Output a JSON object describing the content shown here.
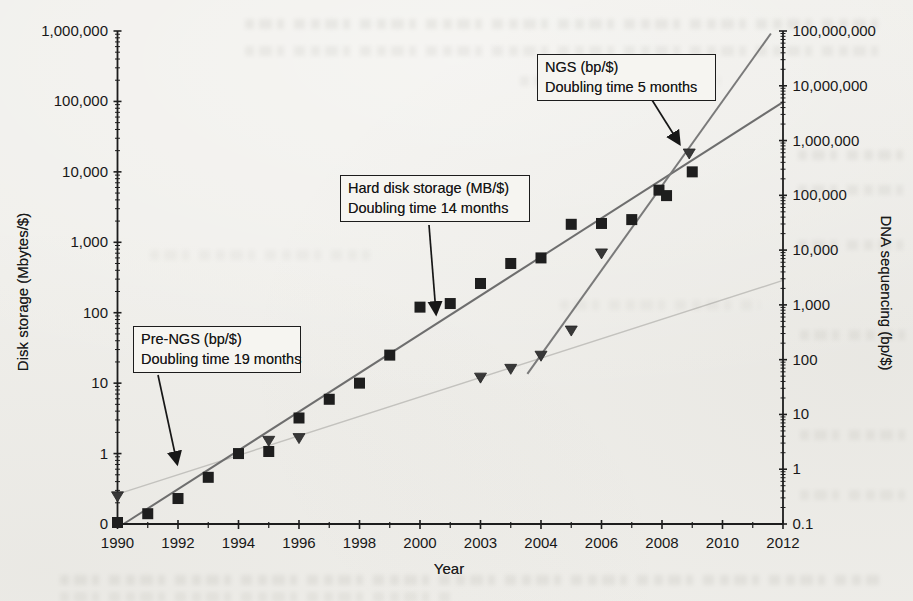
{
  "figure": {
    "xlabel": "Year",
    "ylabel_left": "Disk storage (Mbytes/$)",
    "ylabel_right": "DNA sequencing (bp/$)"
  },
  "annotations": {
    "pre_ngs": {
      "line1": "Pre-NGS (bp/$)",
      "line2": "Doubling time 19 months"
    },
    "hdd": {
      "line1": "Hard disk storage (MB/$)",
      "line2": "Doubling time 14 months"
    },
    "ngs": {
      "line1": "NGS (bp/$)",
      "line2": "Doubling time 5 months"
    }
  },
  "chart_data": {
    "type": "scatter",
    "title": "",
    "xlabel": "Year",
    "x_axis": {
      "range": [
        1990,
        2012
      ],
      "major_ticks": [
        {
          "year": 1990,
          "label": "1990"
        },
        {
          "year": 1992,
          "label": "1992"
        },
        {
          "year": 1994,
          "label": "1994"
        },
        {
          "year": 1996,
          "label": "1996"
        },
        {
          "year": 1998,
          "label": "1998"
        },
        {
          "year": 2000,
          "label": "2000"
        },
        {
          "year": 2002,
          "label": "2003"
        },
        {
          "year": 2004,
          "label": "2004"
        },
        {
          "year": 2006,
          "label": "2006"
        },
        {
          "year": 2008,
          "label": "2008"
        },
        {
          "year": 2010,
          "label": "2010"
        },
        {
          "year": 2012,
          "label": "2012"
        }
      ],
      "minor_tick_years": [
        1991,
        1993,
        1995,
        1997,
        1999,
        2001,
        2003,
        2005,
        2007,
        2009,
        2011
      ]
    },
    "left_axis": {
      "label": "Disk storage (Mbytes/$)",
      "scale": "log",
      "range": [
        0.1,
        1000000
      ],
      "ticks": [
        {
          "value": 1000000,
          "label": "1,000,000"
        },
        {
          "value": 100000,
          "label": "100,000"
        },
        {
          "value": 10000,
          "label": "10,000"
        },
        {
          "value": 1000,
          "label": "1,000"
        },
        {
          "value": 100,
          "label": "100"
        },
        {
          "value": 10,
          "label": "10"
        },
        {
          "value": 1,
          "label": "1"
        },
        {
          "value": 0.1,
          "label": "0"
        }
      ]
    },
    "right_axis": {
      "label": "DNA sequencing (bp/$)",
      "scale": "log",
      "range": [
        0.1,
        100000000
      ],
      "ticks": [
        {
          "value": 100000000,
          "label": "100,000,000"
        },
        {
          "value": 10000000,
          "label": "10,000,000"
        },
        {
          "value": 1000000,
          "label": "1,000,000"
        },
        {
          "value": 100000,
          "label": "100,000"
        },
        {
          "value": 10000,
          "label": "10,000"
        },
        {
          "value": 1000,
          "label": "1,000"
        },
        {
          "value": 100,
          "label": "100"
        },
        {
          "value": 10,
          "label": "10"
        },
        {
          "value": 1,
          "label": "1"
        },
        {
          "value": 0.1,
          "label": "0.1"
        }
      ]
    },
    "series": [
      {
        "name": "Hard disk storage (MB/$)",
        "marker": "square",
        "axis": "left",
        "doubling_time": "14 months",
        "color": "#1e1e1e",
        "points": [
          [
            1990,
            0.105
          ],
          [
            1991,
            0.14
          ],
          [
            1992,
            0.23
          ],
          [
            1993,
            0.46
          ],
          [
            1994,
            1.0
          ],
          [
            1995,
            1.07
          ],
          [
            1996,
            3.2
          ],
          [
            1997,
            5.9
          ],
          [
            1998,
            10
          ],
          [
            1999,
            25
          ],
          [
            2000,
            120
          ],
          [
            2001,
            135
          ],
          [
            2002,
            260
          ],
          [
            2003,
            500
          ],
          [
            2004,
            600
          ],
          [
            2005,
            1800
          ],
          [
            2006,
            1850
          ],
          [
            2007,
            2100
          ],
          [
            2007.9,
            5500
          ],
          [
            2008.15,
            4600
          ],
          [
            2009,
            10000
          ]
        ]
      },
      {
        "name": "DNA sequencing (bp/$)",
        "marker": "triangle-down",
        "axis": "right",
        "doubling_time_pre_ngs": "19 months",
        "doubling_time_ngs": "5 months",
        "color": "#383838",
        "points": [
          [
            1990,
            0.32
          ],
          [
            1995,
            3.3
          ],
          [
            1996,
            3.7
          ],
          [
            2002,
            47
          ],
          [
            2003,
            68
          ],
          [
            2004,
            118
          ],
          [
            2005,
            340
          ],
          [
            2006,
            8700
          ],
          [
            2008.9,
            580000
          ]
        ]
      }
    ],
    "trend_lines": [
      {
        "name": "pre-ngs-trend",
        "axis": "right",
        "color": "#c3c2be",
        "width": 1.4,
        "points": [
          [
            1990.0,
            0.35
          ],
          [
            2012.0,
            2800
          ]
        ]
      },
      {
        "name": "hard-disk-trend",
        "axis": "left",
        "color": "#6e6e6e",
        "width": 2,
        "points": [
          [
            1990.2,
            0.1
          ],
          [
            2012.0,
            98000
          ]
        ]
      },
      {
        "name": "ngs-trend",
        "axis": "right",
        "color": "#7a7a7a",
        "width": 2,
        "points": [
          [
            2003.55,
            55
          ],
          [
            2011.6,
            90000000
          ]
        ]
      }
    ],
    "annotation_arrows": [
      {
        "name": "pre-ngs-arrow",
        "x1": 158,
        "y1": 375,
        "x2": 177,
        "y2": 463
      },
      {
        "name": "hdd-arrow",
        "x1": 429,
        "y1": 225,
        "x2": 436,
        "y2": 313
      },
      {
        "name": "ngs-arrow",
        "x1": 652,
        "y1": 100,
        "x2": 679,
        "y2": 143
      }
    ],
    "legend_position": "none",
    "grid": false
  }
}
